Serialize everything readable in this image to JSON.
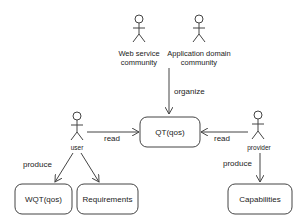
{
  "actors": [
    {
      "id": "web_service_community",
      "label_line1": "Web service",
      "label_line2": "community"
    },
    {
      "id": "application_domain_community",
      "label_line1": "Application domain",
      "label_line2": "community"
    },
    {
      "id": "user",
      "label": "user"
    },
    {
      "id": "provider",
      "label": "provider"
    }
  ],
  "boxes": [
    {
      "id": "qt",
      "label": "QT(qos)"
    },
    {
      "id": "wqt",
      "label": "WQT(qos)"
    },
    {
      "id": "requirements",
      "label": "Requirements"
    },
    {
      "id": "capabilities",
      "label": "Capabilities"
    }
  ],
  "edges": [
    {
      "from": "communities",
      "to": "qt",
      "label": "organize"
    },
    {
      "from": "user",
      "to": "qt",
      "label": "read"
    },
    {
      "from": "provider",
      "to": "qt",
      "label": "read"
    },
    {
      "from": "user",
      "to": "wqt",
      "label": "produce"
    },
    {
      "from": "user",
      "to": "requirements",
      "label": ""
    },
    {
      "from": "provider",
      "to": "capabilities",
      "label": "produce"
    }
  ],
  "colors": {
    "stroke": "#444444",
    "text": "#222222",
    "background": "#ffffff"
  }
}
